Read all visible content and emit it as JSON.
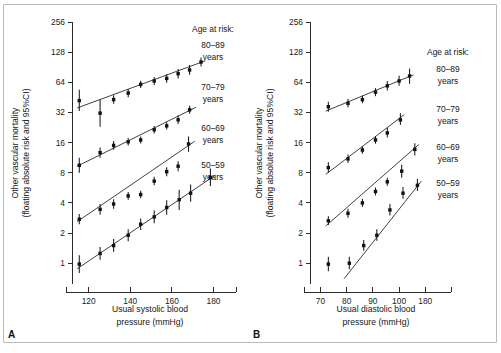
{
  "figure": {
    "background": "#ffffff",
    "frame_color": "#b9b9b9",
    "ink_color": "#1a1a1a"
  },
  "panels": [
    {
      "id": "A",
      "label": "A",
      "ylabel_line1": "Other vascular mortality",
      "ylabel_line2": "(floating absolute risk and 95%CI)",
      "xlabel_line1": "Usual systolic blood",
      "xlabel_line2": "pressure (mmHg)",
      "legend_title": "Age at risk:",
      "legend_items": [
        {
          "range": "80–89",
          "unit": "years"
        },
        {
          "range": "70–79",
          "unit": "years"
        },
        {
          "range": "60–69",
          "unit": "years"
        },
        {
          "range": "50–59",
          "unit": "years"
        }
      ]
    },
    {
      "id": "B",
      "label": "B",
      "ylabel_line1": "Other vascular mortality",
      "ylabel_line2": "(floating absolute risk and 95%CI)",
      "xlabel_line1": "Usual diastolic blood",
      "xlabel_line2": "pressure (mmHg)",
      "legend_title": "Age at risk:",
      "legend_items": [
        {
          "range": "80–89",
          "unit": "years"
        },
        {
          "range": "70–79",
          "unit": "years"
        },
        {
          "range": "60–69",
          "unit": "years"
        },
        {
          "range": "50–59",
          "unit": "years"
        }
      ]
    }
  ],
  "chart_data": [
    {
      "type": "scatter",
      "panel": "A",
      "title": "Other vascular mortality by usual systolic blood pressure",
      "xlabel": "Usual systolic blood pressure (mmHg)",
      "ylabel": "Other vascular mortality (floating absolute risk and 95%CI)",
      "yscale": "log2",
      "ylim": [
        0.62,
        256
      ],
      "yticks": [
        1,
        2,
        4,
        8,
        16,
        32,
        64,
        128,
        256
      ],
      "yticklabels": [
        "1",
        "2",
        "4",
        "8",
        "16",
        "32",
        "64",
        "128",
        "256"
      ],
      "xlim": [
        112,
        186
      ],
      "xticks": [
        120,
        140,
        160,
        180
      ],
      "xticklabels": [
        "120",
        "140",
        "160",
        "180"
      ],
      "grid": false,
      "legend_position": "right",
      "series": [
        {
          "name": "80-89 years",
          "x": [
            115.5,
            125.5,
            132.0,
            139.0,
            145.0,
            151.5,
            157.5,
            163.0,
            168.5,
            174.0
          ],
          "y": [
            42.0,
            31.5,
            43.0,
            50.0,
            61.0,
            66.0,
            70.0,
            78.0,
            85.0,
            102.0
          ],
          "y_low": [
            33.0,
            23.0,
            39.0,
            45.5,
            56.0,
            60.0,
            63.5,
            70.0,
            76.0,
            92.0
          ],
          "y_high": [
            54.0,
            43.0,
            47.5,
            55.0,
            66.5,
            72.5,
            77.0,
            87.0,
            95.0,
            113.0
          ],
          "fit": {
            "x0": 114.5,
            "y0": 35.5,
            "x1": 175.0,
            "y1": 103.0
          }
        },
        {
          "name": "70-79 years",
          "x": [
            115.5,
            125.5,
            132.0,
            139.0,
            145.0,
            151.5,
            157.5,
            163.0,
            168.5
          ],
          "y": [
            9.5,
            12.7,
            15.0,
            16.3,
            17.0,
            21.5,
            23.5,
            27.0,
            34.0
          ],
          "y_low": [
            8.0,
            11.3,
            13.6,
            15.0,
            15.7,
            19.7,
            21.6,
            24.5,
            31.0
          ],
          "y_high": [
            11.3,
            14.3,
            16.6,
            17.8,
            18.4,
            23.5,
            25.6,
            29.8,
            37.3
          ],
          "fit": {
            "x0": 114.5,
            "y0": 9.3,
            "x1": 171.5,
            "y1": 36.0
          }
        },
        {
          "name": "60-69 years",
          "x": [
            115.5,
            125.5,
            132.0,
            139.0,
            145.0,
            151.5,
            157.5,
            163.0,
            168.0
          ],
          "y": [
            2.75,
            3.45,
            3.9,
            4.7,
            4.85,
            6.6,
            8.2,
            9.3,
            15.5
          ],
          "y_low": [
            2.45,
            3.05,
            3.5,
            4.3,
            4.45,
            6.0,
            7.4,
            8.3,
            13.0
          ],
          "y_high": [
            3.1,
            3.9,
            4.35,
            5.15,
            5.3,
            7.3,
            9.1,
            10.4,
            18.4
          ],
          "fit": {
            "x0": 114.5,
            "y0": 2.6,
            "x1": 171.0,
            "y1": 16.5
          }
        },
        {
          "name": "50-59 years",
          "x": [
            115.5,
            125.5,
            132.0,
            139.0,
            145.0,
            151.5,
            157.5,
            163.5,
            169.0,
            178.5
          ],
          "y": [
            0.98,
            1.25,
            1.5,
            1.9,
            2.45,
            2.9,
            3.6,
            4.3,
            5.0,
            7.2
          ],
          "y_low": [
            0.8,
            1.08,
            1.3,
            1.66,
            2.15,
            2.5,
            3.05,
            3.4,
            4.1,
            5.9
          ],
          "y_high": [
            1.2,
            1.45,
            1.74,
            2.18,
            2.8,
            3.35,
            4.25,
            5.4,
            6.1,
            8.8
          ],
          "fit": {
            "x0": 114.5,
            "y0": 0.88,
            "x1": 181.0,
            "y1": 7.6
          }
        }
      ]
    },
    {
      "type": "scatter",
      "panel": "B",
      "title": "Other vascular mortality by usual diastolic blood pressure",
      "xlabel": "Usual diastolic blood pressure (mmHg)",
      "ylabel": "Other vascular mortality (floating absolute risk and 95%CI)",
      "yscale": "log2",
      "ylim": [
        0.62,
        256
      ],
      "yticks": [
        1,
        2,
        4,
        8,
        16,
        32,
        64,
        128,
        256
      ],
      "yticklabels": [
        "1",
        "2",
        "4",
        "8",
        "16",
        "32",
        "64",
        "128",
        "256"
      ],
      "xlim": [
        66,
        116
      ],
      "xticks": [
        70,
        80,
        90,
        100,
        110
      ],
      "xticklabels": [
        "70",
        "80",
        "90",
        "100",
        "180"
      ],
      "grid": false,
      "legend_position": "right",
      "series": [
        {
          "name": "80-89 years",
          "x": [
            73.0,
            80.5,
            86.0,
            91.0,
            95.5,
            100.0,
            104.0
          ],
          "y": [
            36.5,
            39.5,
            43.0,
            51.0,
            59.0,
            66.0,
            74.0
          ],
          "y_low": [
            32.5,
            36.0,
            39.5,
            46.5,
            53.0,
            59.0,
            62.0
          ],
          "y_high": [
            41.0,
            43.5,
            47.0,
            56.0,
            66.0,
            74.5,
            88.0
          ],
          "fit": {
            "x0": 72.0,
            "y0": 33.0,
            "x1": 105.5,
            "y1": 76.0
          }
        },
        {
          "name": "70-79 years",
          "x": [
            73.0,
            80.5,
            86.0,
            91.0,
            95.5,
            100.5
          ],
          "y": [
            9.0,
            11.0,
            13.5,
            17.0,
            20.0,
            27.0
          ],
          "y_low": [
            8.0,
            10.0,
            12.4,
            15.6,
            18.0,
            24.0
          ],
          "y_high": [
            10.2,
            12.2,
            14.8,
            18.6,
            22.4,
            31.5
          ],
          "fit": {
            "x0": 72.0,
            "y0": 7.7,
            "x1": 102.0,
            "y1": 30.5
          }
        },
        {
          "name": "60-69 years",
          "x": [
            73.0,
            80.5,
            86.0,
            91.0,
            95.5,
            101.0,
            106.0
          ],
          "y": [
            2.65,
            3.15,
            4.0,
            5.2,
            6.5,
            8.3,
            13.7
          ],
          "y_low": [
            2.4,
            2.85,
            3.65,
            4.75,
            5.95,
            7.15,
            11.9
          ],
          "y_high": [
            2.95,
            3.5,
            4.4,
            5.7,
            7.15,
            9.6,
            15.8
          ],
          "fit": {
            "x0": 72.0,
            "y0": 2.35,
            "x1": 107.5,
            "y1": 15.3
          }
        },
        {
          "name": "50-59 years",
          "x": [
            73.0,
            81.0,
            86.5,
            91.5,
            96.5,
            101.5,
            107.0
          ],
          "y": [
            0.98,
            1.0,
            1.5,
            1.9,
            3.4,
            5.0,
            6.0
          ],
          "y_low": [
            0.83,
            0.87,
            1.33,
            1.68,
            3.0,
            4.4,
            5.25
          ],
          "y_high": [
            1.16,
            1.16,
            1.7,
            2.18,
            3.9,
            5.75,
            6.95
          ],
          "fit": {
            "x0": 79.0,
            "y0": 0.7,
            "x1": 108.5,
            "y1": 6.6
          }
        }
      ]
    }
  ]
}
